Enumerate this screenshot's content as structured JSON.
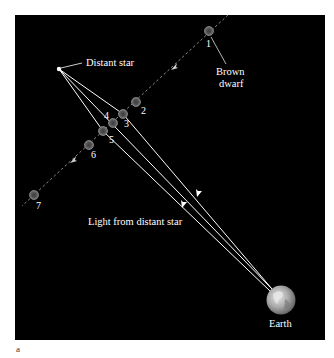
{
  "labels": {
    "distant_star": "Distant star",
    "brown_dwarf_line1": "Brown",
    "brown_dwarf_line2": "dwarf",
    "light": "Light from distant star",
    "earth": "Earth"
  },
  "positions": [
    {
      "label": "1"
    },
    {
      "label": "2"
    },
    {
      "label": "3"
    },
    {
      "label": "4"
    },
    {
      "label": "5"
    },
    {
      "label": "6"
    },
    {
      "label": "7"
    }
  ],
  "caption": "a",
  "colors": {
    "background": "#000000",
    "line": "#ffffff",
    "dwarf": "#5a5a5a",
    "dwarf_ring": "#8a8a8a",
    "earth": "#b0b0b0"
  }
}
